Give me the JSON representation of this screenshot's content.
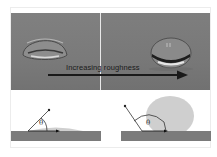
{
  "figure": {
    "arrow_label": "Increasing roughness",
    "left_diagram": {
      "angle_label": "θ",
      "description": "low contact angle, spreading droplet"
    },
    "right_diagram": {
      "angle_label": "θ",
      "description": "high contact angle, beading droplet"
    }
  },
  "colors": {
    "photo_bg": "#7a7a7a",
    "substrate": "#7b7b7b",
    "droplet_fill": "#c8c8c8",
    "arrow": "#1a1a1a",
    "frame_border": "#ececec"
  }
}
